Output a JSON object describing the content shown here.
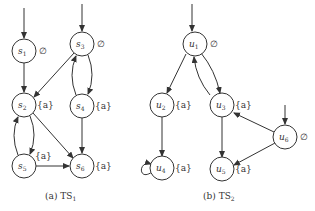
{
  "diagrams": [
    {
      "id": "ts1",
      "caption_prefix": "(a) TS",
      "caption_sub": "1",
      "nodes": [
        {
          "id": "s1",
          "name": "s",
          "sub": "1",
          "label": "∅",
          "initial": true
        },
        {
          "id": "s2",
          "name": "s",
          "sub": "2",
          "label": "{a}",
          "initial": false
        },
        {
          "id": "s3",
          "name": "s",
          "sub": "3",
          "label": "∅",
          "initial": true
        },
        {
          "id": "s4",
          "name": "s",
          "sub": "4",
          "label": "{a}",
          "initial": false
        },
        {
          "id": "s5",
          "name": "s",
          "sub": "5",
          "label": "{a}",
          "initial": false
        },
        {
          "id": "s6",
          "name": "s",
          "sub": "6",
          "label": "{a}",
          "initial": false
        }
      ],
      "edges": [
        [
          "s1",
          "s2"
        ],
        [
          "s3",
          "s2"
        ],
        [
          "s3",
          "s4"
        ],
        [
          "s4",
          "s3"
        ],
        [
          "s4",
          "s6"
        ],
        [
          "s2",
          "s5"
        ],
        [
          "s5",
          "s2"
        ],
        [
          "s2",
          "s6"
        ],
        [
          "s5",
          "s6"
        ]
      ]
    },
    {
      "id": "ts2",
      "caption_prefix": "(b) TS",
      "caption_sub": "2",
      "nodes": [
        {
          "id": "u1",
          "name": "u",
          "sub": "1",
          "label": "∅",
          "initial": true
        },
        {
          "id": "u2",
          "name": "u",
          "sub": "2",
          "label": "{a}",
          "initial": false
        },
        {
          "id": "u3",
          "name": "u",
          "sub": "3",
          "label": "{a}",
          "initial": false
        },
        {
          "id": "u4",
          "name": "u",
          "sub": "4",
          "label": "{a}",
          "initial": false
        },
        {
          "id": "u5",
          "name": "u",
          "sub": "5",
          "label": "{a}",
          "initial": false
        },
        {
          "id": "u6",
          "name": "u",
          "sub": "6",
          "label": "∅",
          "initial": true
        }
      ],
      "edges": [
        [
          "u1",
          "u2"
        ],
        [
          "u1",
          "u3"
        ],
        [
          "u3",
          "u1"
        ],
        [
          "u2",
          "u4"
        ],
        [
          "u4",
          "u4"
        ],
        [
          "u3",
          "u5"
        ],
        [
          "u6",
          "u3"
        ],
        [
          "u6",
          "u5"
        ]
      ]
    }
  ]
}
